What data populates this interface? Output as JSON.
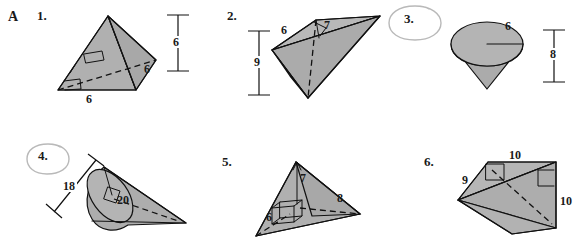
{
  "worksheet": {
    "section_letter": "A",
    "fill_color": "#b0b0b0",
    "line_color": "#111111",
    "circle_mark_color": "#b9b9b9",
    "background": "#ffffff"
  },
  "items": [
    {
      "number": "1.",
      "shape": "square-pyramid",
      "circled": false,
      "dimensions": [
        {
          "label": "6",
          "role": "base-edge-front"
        },
        {
          "label": "6",
          "role": "base-edge-right"
        },
        {
          "label": "6",
          "role": "height-bar"
        }
      ],
      "right_angle_marks": 2,
      "has_hidden_edge": true
    },
    {
      "number": "2.",
      "shape": "oblique-triangular-pyramid",
      "circled": false,
      "dimensions": [
        {
          "label": "6",
          "role": "top-edge-left"
        },
        {
          "label": "7",
          "role": "top-edge-right"
        },
        {
          "label": "9",
          "role": "height-bar"
        }
      ],
      "right_angle_marks": 1,
      "has_hidden_edge": true
    },
    {
      "number": "3.",
      "shape": "inverted-cone",
      "circled": true,
      "dimensions": [
        {
          "label": "6",
          "role": "radius"
        },
        {
          "label": "8",
          "role": "height-bar"
        }
      ],
      "right_angle_marks": 0,
      "has_hidden_edge": false
    },
    {
      "number": "4.",
      "shape": "tilted-cone",
      "circled": true,
      "dimensions": [
        {
          "label": "18",
          "role": "diameter-bar"
        },
        {
          "label": "20",
          "role": "axis"
        }
      ],
      "right_angle_marks": 1,
      "has_hidden_edge": true
    },
    {
      "number": "5.",
      "shape": "triangular-pyramid",
      "circled": false,
      "dimensions": [
        {
          "label": "7",
          "role": "height"
        },
        {
          "label": "8",
          "role": "base-edge-right"
        },
        {
          "label": "6",
          "role": "base-edge-left"
        }
      ],
      "right_angle_marks": 1,
      "has_hidden_edge": true
    },
    {
      "number": "6.",
      "shape": "oblique-prism",
      "circled": false,
      "dimensions": [
        {
          "label": "10",
          "role": "top-edge"
        },
        {
          "label": "9",
          "role": "slant-edge"
        },
        {
          "label": "10",
          "role": "right-edge"
        }
      ],
      "right_angle_marks": 2,
      "has_hidden_edge": true
    }
  ]
}
